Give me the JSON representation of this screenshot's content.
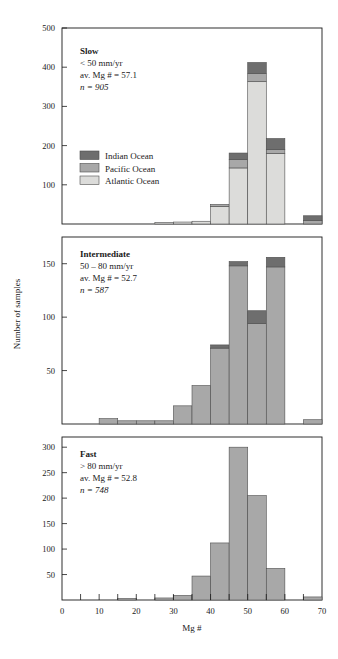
{
  "figure": {
    "xlabel": "Mg #",
    "ylabel": "Number of samples"
  },
  "colors": {
    "indian": "#6e6e6e",
    "pacific": "#a8a8a8",
    "atlantic": "#dcdcda",
    "axis": "#1a1a1a",
    "barstroke": "#4d4d4d",
    "background": "#ffffff"
  },
  "legend": {
    "position": "inside-upper-left-panel1",
    "entries": [
      {
        "label": "Indian Ocean",
        "key": "indian",
        "color": "#6e6e6e"
      },
      {
        "label": "Pacific Ocean",
        "key": "pacific",
        "color": "#a8a8a8"
      },
      {
        "label": "Atlantic Ocean",
        "key": "atlantic",
        "color": "#dcdcda"
      }
    ]
  },
  "chart_data": {
    "type": "bar",
    "subtype": "stacked-histogram",
    "title": "",
    "xlabel": "Mg #",
    "ylabel": "Number of samples",
    "grid": false,
    "bin_width": 5,
    "xlim": [
      0,
      70
    ],
    "x_ticks_major": [
      0,
      10,
      20,
      30,
      40,
      50,
      60,
      70
    ],
    "x_ticks_minor": [
      5,
      15,
      25,
      35,
      45,
      55,
      65
    ],
    "bin_starts": [
      0,
      5,
      10,
      15,
      20,
      25,
      30,
      35,
      40,
      45,
      50,
      55,
      60,
      65
    ],
    "series_order": [
      "atlantic",
      "pacific",
      "indian"
    ],
    "panels": [
      {
        "id": "slow",
        "name": "Slow",
        "annotation": {
          "title": "Slow",
          "rate": "< 50 mm/yr",
          "avg": "av. Mg # = 57.1",
          "n": "n = 905"
        },
        "ylim": [
          0,
          500
        ],
        "y_ticks": [
          0,
          100,
          200,
          300,
          400,
          500
        ],
        "y_tick_labels": [
          "",
          "100",
          "200",
          "300",
          "400",
          "500"
        ],
        "series": [
          {
            "name": "Atlantic Ocean",
            "key": "atlantic",
            "values": [
              0,
              0,
              0,
              0,
              0,
              4,
              5,
              7,
              45,
              143,
              363,
              180,
              0,
              0
            ]
          },
          {
            "name": "Pacific Ocean",
            "key": "pacific",
            "values": [
              0,
              0,
              0,
              0,
              0,
              0,
              0,
              0,
              5,
              22,
              21,
              10,
              0,
              9
            ]
          },
          {
            "name": "Indian Ocean",
            "key": "indian",
            "values": [
              0,
              0,
              0,
              0,
              0,
              0,
              0,
              0,
              0,
              16,
              28,
              28,
              0,
              12
            ]
          }
        ],
        "totals": [
          0,
          0,
          0,
          0,
          0,
          4,
          5,
          7,
          50,
          181,
          412,
          218,
          0,
          21
        ]
      },
      {
        "id": "intermediate",
        "name": "Intermediate",
        "annotation": {
          "title": "Intermediate",
          "rate": "50 – 80 mm/yr",
          "avg": "av. Mg # = 52.7",
          "n": "n = 587"
        },
        "ylim": [
          0,
          175
        ],
        "y_ticks": [
          0,
          50,
          100,
          150
        ],
        "y_tick_labels": [
          "",
          "50",
          "100",
          "150"
        ],
        "series": [
          {
            "name": "Atlantic Ocean",
            "key": "atlantic",
            "values": [
              0,
              0,
              0,
              0,
              0,
              0,
              0,
              0,
              0,
              0,
              0,
              0,
              0,
              0
            ]
          },
          {
            "name": "Pacific Ocean",
            "key": "pacific",
            "values": [
              0,
              0,
              5,
              3,
              3,
              3,
              17,
              36,
              71,
              148,
              94,
              147,
              0,
              4
            ]
          },
          {
            "name": "Indian Ocean",
            "key": "indian",
            "values": [
              0,
              0,
              0,
              0,
              0,
              0,
              0,
              0,
              3,
              4,
              12,
              9,
              0,
              0
            ]
          }
        ],
        "totals": [
          0,
          0,
          5,
          3,
          3,
          3,
          17,
          36,
          74,
          152,
          106,
          156,
          0,
          4
        ]
      },
      {
        "id": "fast",
        "name": "Fast",
        "annotation": {
          "title": "Fast",
          "rate": "> 80 mm/yr",
          "avg": "av. Mg # = 52.8",
          "n": "n = 748"
        },
        "ylim": [
          0,
          320
        ],
        "y_ticks": [
          0,
          50,
          100,
          150,
          200,
          250,
          300
        ],
        "y_tick_labels": [
          "",
          "50",
          "100",
          "150",
          "200",
          "250",
          "300"
        ],
        "series": [
          {
            "name": "Atlantic Ocean",
            "key": "atlantic",
            "values": [
              0,
              0,
              0,
              0,
              0,
              0,
              0,
              0,
              0,
              0,
              0,
              0,
              0,
              0
            ]
          },
          {
            "name": "Pacific Ocean",
            "key": "pacific",
            "values": [
              0,
              0,
              0,
              3,
              0,
              4,
              9,
              47,
              112,
              300,
              205,
              62,
              0,
              6
            ]
          },
          {
            "name": "Indian Ocean",
            "key": "indian",
            "values": [
              0,
              0,
              0,
              0,
              0,
              0,
              0,
              0,
              0,
              0,
              0,
              0,
              0,
              0
            ]
          }
        ],
        "totals": [
          0,
          0,
          0,
          3,
          0,
          4,
          9,
          47,
          112,
          300,
          205,
          62,
          0,
          6
        ]
      }
    ]
  }
}
